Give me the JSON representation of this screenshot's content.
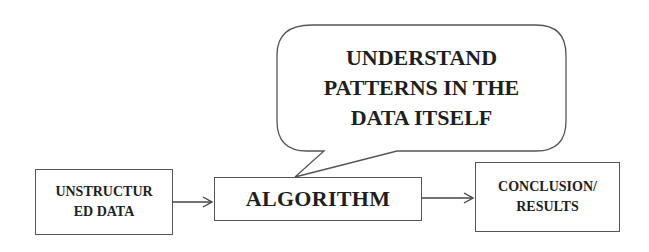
{
  "diagram": {
    "type": "flowchart",
    "nodes": [
      {
        "id": "input",
        "lines": [
          "UNSTRUCTUR",
          "ED DATA"
        ],
        "label": "UNSTRUCTURED DATA"
      },
      {
        "id": "algorithm",
        "lines": [
          "ALGORITHM"
        ],
        "label": "ALGORITHM"
      },
      {
        "id": "output",
        "lines": [
          "CONCLUSION/",
          "RESULTS"
        ],
        "label": "CONCLUSION/ RESULTS"
      }
    ],
    "callout": {
      "attached_to": "algorithm",
      "lines": [
        "UNDERSTAND",
        "PATTERNS IN THE",
        "DATA ITSELF"
      ],
      "label": "UNDERSTAND PATTERNS IN THE DATA ITSELF"
    },
    "edges": [
      {
        "from": "input",
        "to": "algorithm"
      },
      {
        "from": "algorithm",
        "to": "output"
      }
    ],
    "colors": {
      "stroke": "#555555",
      "text": "#1e1e1e",
      "background": "#ffffff"
    }
  }
}
